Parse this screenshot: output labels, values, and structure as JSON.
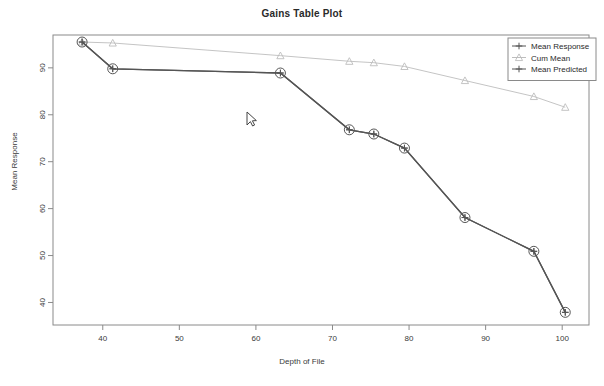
{
  "chart_data": {
    "type": "line",
    "title": "Gains Table Plot",
    "xlabel": "Depth of File",
    "ylabel": "Mean Response",
    "xlim": [
      33.5,
      103.5
    ],
    "ylim": [
      35.2,
      97.0
    ],
    "xticks": [
      40,
      50,
      60,
      70,
      80,
      90,
      100
    ],
    "yticks": [
      40,
      50,
      60,
      70,
      80,
      90
    ],
    "grid": false,
    "legend_position": "top-right",
    "series": [
      {
        "name": "Mean Response",
        "color": "#555555",
        "marker": "circle-plus",
        "x": [
          37.3,
          41.3,
          63.2,
          72.2,
          75.4,
          79.4,
          87.3,
          96.3,
          100.4
        ],
        "y": [
          95.5,
          89.8,
          88.9,
          76.8,
          75.9,
          72.9,
          58.1,
          50.9,
          37.9
        ]
      },
      {
        "name": "Cum Mean",
        "color": "#bdbdbd",
        "marker": "triangle",
        "x": [
          37.3,
          41.3,
          63.2,
          72.2,
          75.4,
          79.4,
          87.3,
          96.3,
          100.4
        ],
        "y": [
          95.5,
          95.3,
          92.6,
          91.4,
          91.1,
          90.3,
          87.3,
          83.9,
          81.6
        ]
      },
      {
        "name": "Mean Predicted",
        "color": "#555555",
        "marker": "plus",
        "x": [
          37.3,
          41.3,
          63.2,
          72.2,
          75.4,
          79.4,
          87.3,
          96.3,
          100.4
        ],
        "y": [
          95.5,
          89.8,
          88.9,
          76.8,
          75.9,
          72.9,
          58.1,
          50.9,
          37.9
        ]
      }
    ]
  },
  "legend": {
    "items": [
      {
        "label": "Mean Response",
        "color": "#555555",
        "marker": "circle-plus"
      },
      {
        "label": "Cum Mean",
        "color": "#bdbdbd",
        "marker": "triangle"
      },
      {
        "label": "Mean Predicted",
        "color": "#555555",
        "marker": "plus"
      }
    ]
  },
  "cursor": {
    "x": 247,
    "y": 112,
    "name": "mouse-pointer"
  },
  "colors": {
    "axis": "#8a8a8a",
    "text": "#3a3a3a",
    "title": "#2a2a2a",
    "primary_series": "#555555",
    "secondary_series": "#bdbdbd",
    "background": "#ffffff"
  }
}
